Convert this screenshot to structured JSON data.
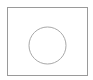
{
  "figure": {
    "shapes": [
      "rectangle",
      "circle"
    ],
    "colors": {
      "background": "#ffffff",
      "rect_stroke": "#9a9a9a",
      "circle_stroke": "#a8a8a8"
    }
  }
}
